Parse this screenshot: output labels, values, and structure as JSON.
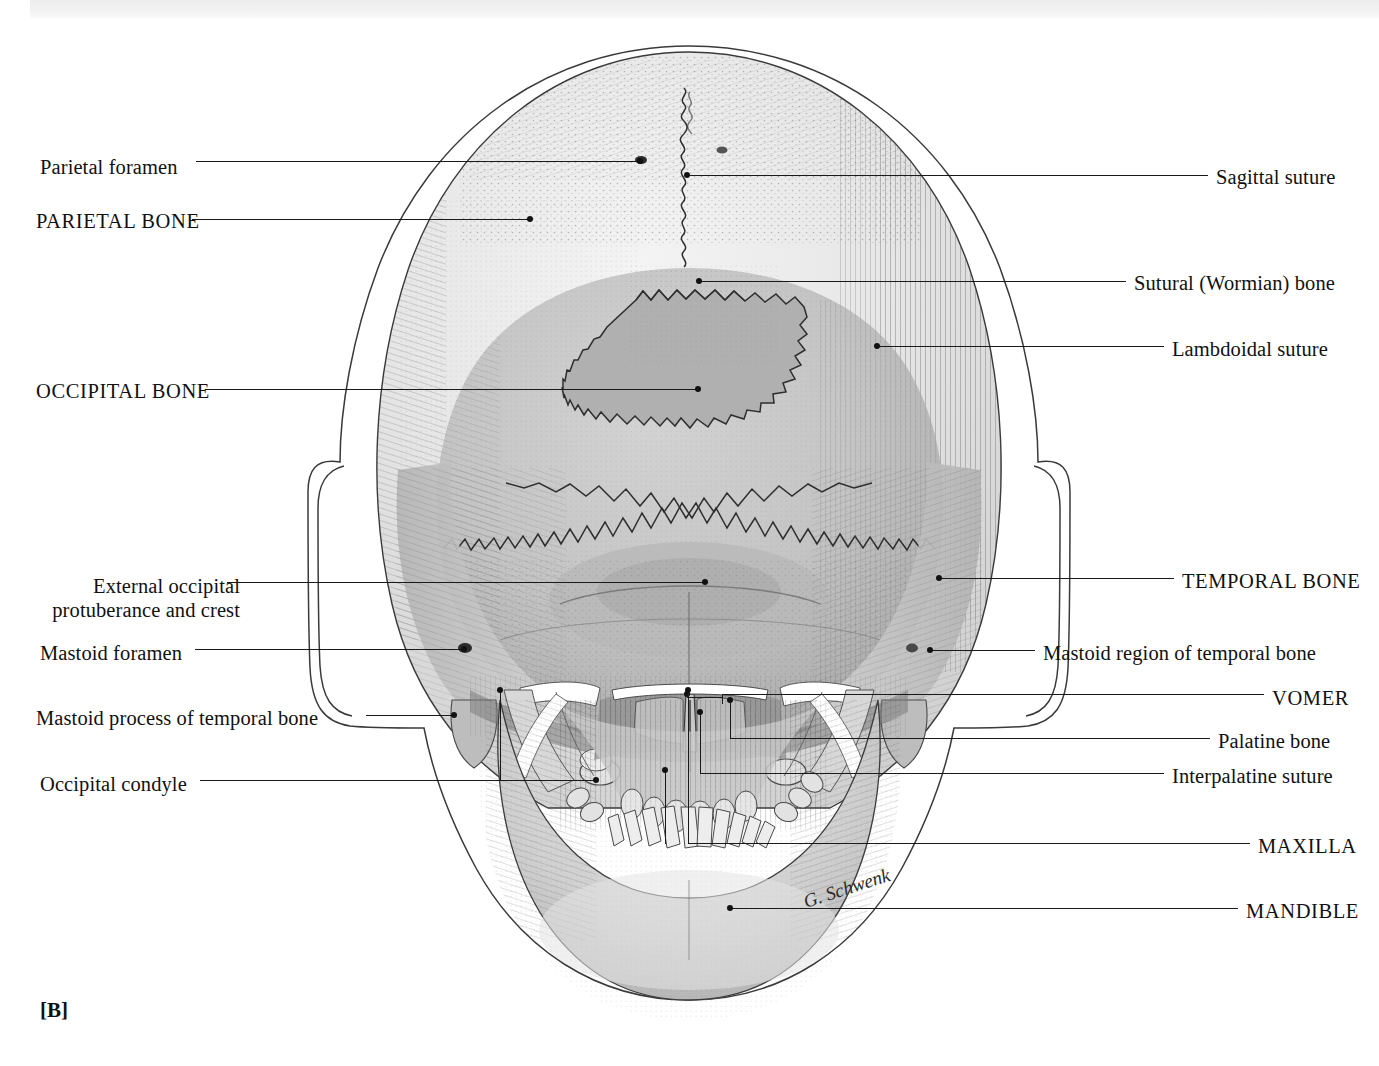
{
  "figure": {
    "panel_label": "[B]",
    "signature": "G. Schwenk",
    "view": "Posterior view of the skull",
    "colors": {
      "ink": "#1a1a1a",
      "parietal_fill": "#e7e7e7",
      "occipital_fill": "#c6c6c6",
      "wormian_fill": "#b0b0b0",
      "temporal_fill": "#bcbcbc",
      "mandible_fill": "#d5d5d5",
      "soft_tissue_outline": "#333333",
      "page_background": "#ffffff"
    }
  },
  "labels_left": [
    {
      "id": "parietal-foramen",
      "text": "Parietal foramen",
      "text_x": 40,
      "text_y": 167,
      "line_y": 161,
      "line_x1": 196,
      "line_x2": 642,
      "dot_x": 640,
      "dot_y": 161
    },
    {
      "id": "parietal-bone",
      "text": "PARIETAL BONE",
      "text_x": 36,
      "text_y": 222,
      "line_y": 219,
      "line_x1": 192,
      "line_x2": 532,
      "dot_x": 530,
      "dot_y": 219
    },
    {
      "id": "occipital-bone",
      "text": "OCCIPITAL BONE",
      "text_x": 36,
      "text_y": 392,
      "line_y": 389,
      "line_x1": 205,
      "line_x2": 700,
      "dot_x": 698,
      "dot_y": 389
    },
    {
      "id": "external-occipital",
      "text": "External occipital",
      "text2": "protuberance and crest",
      "text_x": 40,
      "text_y": 586,
      "line_y": 582,
      "line_x1": 227,
      "line_x2": 707,
      "dot_x": 705,
      "dot_y": 582
    },
    {
      "id": "mastoid-foramen",
      "text": "Mastoid foramen",
      "text_x": 40,
      "text_y": 653,
      "line_y": 649,
      "line_x1": 195,
      "line_x2": 466,
      "dot_x": 464,
      "dot_y": 649
    },
    {
      "id": "mastoid-process",
      "text": "Mastoid process of temporal bone",
      "text_x": 36,
      "text_y": 718,
      "line_y": 715,
      "line_x1": 366,
      "line_x2": 456,
      "dot_x": 454,
      "dot_y": 715
    },
    {
      "id": "occipital-condyle",
      "text": "Occipital condyle",
      "text_x": 40,
      "text_y": 784,
      "line_y": 780,
      "line_x1": 200,
      "line_x2": 598,
      "dot_x": 596,
      "dot_y": 780
    }
  ],
  "labels_right": [
    {
      "id": "sagittal-suture",
      "text": "Sagittal suture",
      "text_x": 1216,
      "text_y": 177,
      "line_y": 175,
      "line_x1": 688,
      "line_x2": 1208,
      "dot_x": 686,
      "dot_y": 175
    },
    {
      "id": "sutural-wormian-bone",
      "text": "Sutural (Wormian) bone",
      "text_x": 1134,
      "text_y": 283,
      "line_y": 281,
      "line_x1": 701,
      "line_x2": 1126,
      "dot_x": 699,
      "dot_y": 281
    },
    {
      "id": "lambdoidal-suture",
      "text": "Lambdoidal suture",
      "text_x": 1172,
      "text_y": 349,
      "line_y": 346,
      "line_x1": 879,
      "line_x2": 1164,
      "dot_x": 877,
      "dot_y": 346
    },
    {
      "id": "temporal-bone",
      "text": "TEMPORAL BONE",
      "text_x": 1182,
      "text_y": 581,
      "line_y": 578,
      "line_x1": 941,
      "line_x2": 1174,
      "dot_x": 939,
      "dot_y": 578
    },
    {
      "id": "mastoid-region",
      "text": "Mastoid region of temporal bone",
      "text_x": 1043,
      "text_y": 653,
      "line_y": 650,
      "line_x1": 932,
      "line_x2": 1035,
      "dot_x": 930,
      "dot_y": 650
    },
    {
      "id": "vomer",
      "text": "VOMER",
      "text_x": 1272,
      "text_y": 698,
      "line_y": 694,
      "line_x1": 722,
      "line_x2": 1264,
      "dot_x": 720,
      "dot_y": 694
    },
    {
      "id": "palatine-bone",
      "text": "Palatine bone",
      "text_x": 1218,
      "text_y": 741,
      "line_y": 738,
      "line_x1": 730,
      "line_x2": 1210,
      "dot_x": 728,
      "dot_y": 738
    },
    {
      "id": "interpalatine-suture",
      "text": "Interpalatine suture",
      "text_x": 1172,
      "text_y": 776,
      "line_y": 773,
      "line_x1": 700,
      "line_x2": 1164,
      "dot_x": 698,
      "dot_y": 773
    },
    {
      "id": "maxilla",
      "text": "MAXILLA",
      "text_x": 1258,
      "text_y": 846,
      "line_y": 843,
      "line_x1": 688,
      "line_x2": 1250,
      "dot_x": 686,
      "dot_y": 843
    },
    {
      "id": "mandible",
      "text": "MANDIBLE",
      "text_x": 1246,
      "text_y": 911,
      "line_y": 908,
      "line_x1": 732,
      "line_x2": 1238,
      "dot_x": 730,
      "dot_y": 908
    }
  ]
}
